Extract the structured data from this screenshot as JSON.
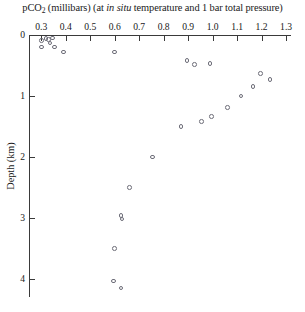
{
  "chart_data": {
    "type": "scatter",
    "title": "pCO2 (millibars) (at in situ temperature and 1 bar total pressure)",
    "title_parts": {
      "lead": "pCO",
      "subscript": "2",
      "mid": " (millibars) (at ",
      "italic": "in situ",
      "tail": " temperature and 1 bar total pressure)"
    },
    "xlabel": "pCO2 (millibars)",
    "ylabel": "Depth (km)",
    "xlim": [
      0.25,
      1.32
    ],
    "ylim": [
      0,
      4.3
    ],
    "y_inverted": true,
    "x_axis_position": "top",
    "grid": false,
    "legend": null,
    "marker": "open-circle",
    "marker_color": "#6d6d78",
    "xticks": [
      0.3,
      0.4,
      0.5,
      0.6,
      0.7,
      0.8,
      0.9,
      1.0,
      1.1,
      1.2,
      1.3
    ],
    "xtick_labels": [
      "0.3",
      "0.4",
      "0.5",
      "0.6",
      "0.7",
      "0.8",
      "0.9",
      "1.0",
      "1.1",
      "1.2",
      "1.3"
    ],
    "yticks": [
      0,
      1,
      2,
      3,
      4
    ],
    "ytick_labels": [
      "0",
      "1",
      "2",
      "3",
      "4"
    ],
    "points": [
      {
        "x": 0.3,
        "y": 0.09
      },
      {
        "x": 0.32,
        "y": 0.06
      },
      {
        "x": 0.33,
        "y": 0.07
      },
      {
        "x": 0.335,
        "y": 0.13
      },
      {
        "x": 0.345,
        "y": 0.05
      },
      {
        "x": 0.3,
        "y": 0.2
      },
      {
        "x": 0.355,
        "y": 0.2
      },
      {
        "x": 0.39,
        "y": 0.28
      },
      {
        "x": 0.6,
        "y": 0.28
      },
      {
        "x": 0.895,
        "y": 0.42
      },
      {
        "x": 0.925,
        "y": 0.48
      },
      {
        "x": 0.99,
        "y": 0.47
      },
      {
        "x": 1.195,
        "y": 0.63
      },
      {
        "x": 1.235,
        "y": 0.73
      },
      {
        "x": 1.165,
        "y": 0.85
      },
      {
        "x": 1.115,
        "y": 1.0
      },
      {
        "x": 1.06,
        "y": 1.19
      },
      {
        "x": 0.995,
        "y": 1.34
      },
      {
        "x": 0.955,
        "y": 1.42
      },
      {
        "x": 0.87,
        "y": 1.5
      },
      {
        "x": 0.755,
        "y": 2.0
      },
      {
        "x": 0.66,
        "y": 2.5
      },
      {
        "x": 0.625,
        "y": 2.96
      },
      {
        "x": 0.63,
        "y": 3.02
      },
      {
        "x": 0.6,
        "y": 3.5
      },
      {
        "x": 0.595,
        "y": 4.04
      },
      {
        "x": 0.625,
        "y": 4.15
      }
    ]
  }
}
